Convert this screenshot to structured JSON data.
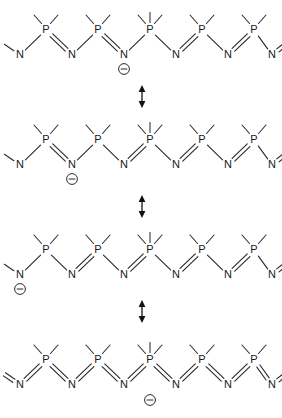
{
  "diagram": {
    "atom_labels": {
      "phosphorus": "P",
      "nitrogen": "N"
    },
    "charge_symbol": "⊖",
    "charge_sign": "minus",
    "arrow_symbol": "resonance-double-headed-arrow",
    "arrow_count": 3,
    "structure_count": 4,
    "colors": {
      "bond": "#2b2b2b",
      "atom_text": "#1a1a1a",
      "arrow": "#111111",
      "background": "#ffffff"
    },
    "structures": [
      {
        "id": "structure-1",
        "name": "resonance-structure-1",
        "charge_on": "N3",
        "charge_position_label": "nitrogen-3-center",
        "backbone": [
          "N1",
          "P1",
          "N2",
          "P2",
          "N3",
          "P3",
          "N4",
          "P4",
          "N5",
          "P5",
          "N6"
        ],
        "bond_orders": [
          "single",
          "double",
          "single",
          "double",
          "single",
          "single",
          "double",
          "single",
          "double",
          "single",
          "double"
        ],
        "terminal_left_bond": "single",
        "terminal_right_bond": "double"
      },
      {
        "id": "structure-2",
        "name": "resonance-structure-2",
        "charge_on": "N2",
        "charge_position_label": "nitrogen-2-left-of-center",
        "backbone": [
          "N1",
          "P1",
          "N2",
          "P2",
          "N3",
          "P3",
          "N4",
          "P4",
          "N5",
          "P5",
          "N6"
        ],
        "bond_orders": [
          "single",
          "double",
          "single",
          "single",
          "double",
          "single",
          "double",
          "single",
          "double",
          "single",
          "double"
        ],
        "terminal_left_bond": "single",
        "terminal_right_bond": "double"
      },
      {
        "id": "structure-3",
        "name": "resonance-structure-3",
        "charge_on": "N1",
        "charge_position_label": "nitrogen-1-leftmost",
        "backbone": [
          "N1",
          "P1",
          "N2",
          "P2",
          "N3",
          "P3",
          "N4",
          "P4",
          "N5",
          "P5",
          "N6"
        ],
        "bond_orders": [
          "single",
          "single",
          "double",
          "single",
          "double",
          "single",
          "double",
          "single",
          "double",
          "single",
          "double"
        ],
        "terminal_left_bond": "single",
        "terminal_right_bond": "double"
      },
      {
        "id": "structure-4",
        "name": "resonance-structure-4",
        "charge_on": "P3",
        "charge_position_label": "phosphorus-3-center-below",
        "backbone": [
          "N1",
          "P1",
          "N2",
          "P2",
          "N3",
          "P3",
          "N4",
          "P4",
          "N5",
          "P5",
          "N6"
        ],
        "bond_orders": [
          "double",
          "double",
          "double",
          "double",
          "double",
          "double",
          "double",
          "double",
          "double",
          "double",
          "double"
        ],
        "terminal_left_bond": "double",
        "terminal_right_bond": "double"
      }
    ],
    "arrows": [
      {
        "id": "arrow-1",
        "name": "resonance-arrow-1",
        "between": "structure-1-and-structure-2"
      },
      {
        "id": "arrow-2",
        "name": "resonance-arrow-2",
        "between": "structure-2-and-structure-3"
      },
      {
        "id": "arrow-3",
        "name": "resonance-arrow-3",
        "between": "structure-3-and-structure-4"
      }
    ]
  }
}
